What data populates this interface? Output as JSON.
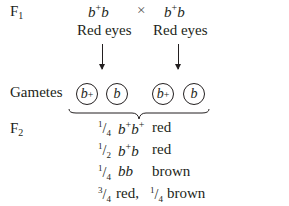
{
  "generations": {
    "f1_label": "F",
    "f1_sub": "1",
    "gametes_label": "Gametes",
    "f2_label": "F",
    "f2_sub": "2"
  },
  "cross": {
    "symbol": "×",
    "parents": [
      {
        "allele1_base": "b",
        "allele1_sup": "+",
        "allele2": "b",
        "phenotype": "Red eyes"
      },
      {
        "allele1_base": "b",
        "allele1_sup": "+",
        "allele2": "b",
        "phenotype": "Red eyes"
      }
    ]
  },
  "gametes": [
    {
      "base": "b",
      "sup": "+"
    },
    {
      "base": "b",
      "sup": ""
    },
    {
      "base": "b",
      "sup": "+"
    },
    {
      "base": "b",
      "sup": ""
    }
  ],
  "f2_results": [
    {
      "num": "1",
      "den": "4",
      "genotype_parts": [
        [
          "b",
          "+"
        ],
        [
          "b",
          "+"
        ]
      ],
      "phenotype": "red"
    },
    {
      "num": "1",
      "den": "2",
      "genotype_parts": [
        [
          "b",
          "+"
        ],
        [
          "b",
          ""
        ]
      ],
      "phenotype": "red"
    },
    {
      "num": "1",
      "den": "4",
      "genotype_parts": [
        [
          "b",
          ""
        ],
        [
          "b",
          ""
        ]
      ],
      "phenotype": "brown"
    }
  ],
  "summary": {
    "red_num": "3",
    "red_den": "4",
    "red_label": "red,",
    "brown_num": "1",
    "brown_den": "4",
    "brown_label": "brown"
  }
}
